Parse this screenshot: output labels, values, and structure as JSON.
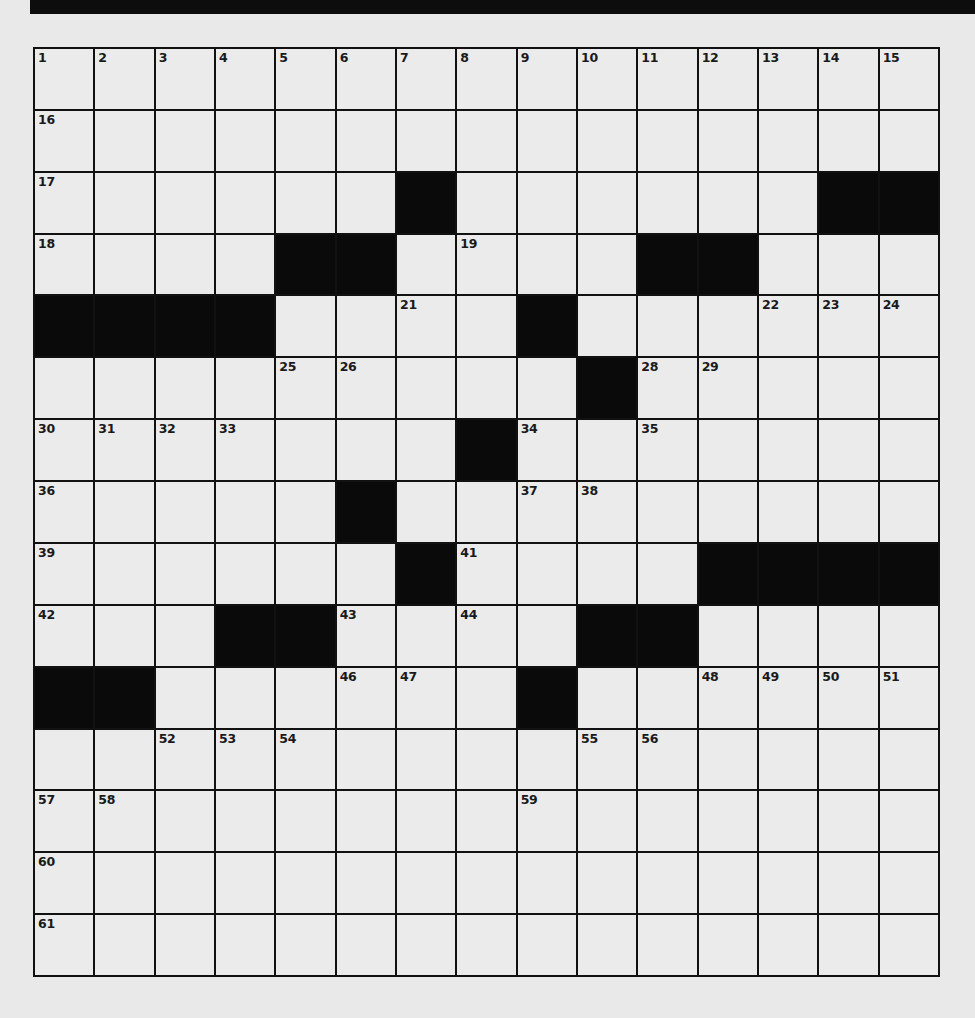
{
  "puzzle": {
    "size": {
      "rows": 15,
      "cols": 15
    },
    "colors": {
      "background": "#e9e9e9",
      "cell_white": "#ebebeb",
      "cell_black": "#0a0a0a",
      "grid_line": "#111111",
      "banner": "#0d0d0d"
    },
    "layout": [
      "...............",
      "...............",
      "......#......##",
      "....##....##...",
      "####....#......",
      ".........#.....",
      ".......#.......",
      ".....#.........",
      "......#....####",
      "...##....##....",
      "##......#......",
      "...............",
      "...............",
      "...............",
      "..............."
    ],
    "numbers": [
      {
        "row": 0,
        "col": 0,
        "n": "1"
      },
      {
        "row": 0,
        "col": 1,
        "n": "2"
      },
      {
        "row": 0,
        "col": 2,
        "n": "3"
      },
      {
        "row": 0,
        "col": 3,
        "n": "4"
      },
      {
        "row": 0,
        "col": 4,
        "n": "5"
      },
      {
        "row": 0,
        "col": 5,
        "n": "6"
      },
      {
        "row": 0,
        "col": 6,
        "n": "7"
      },
      {
        "row": 0,
        "col": 7,
        "n": "8"
      },
      {
        "row": 0,
        "col": 8,
        "n": "9"
      },
      {
        "row": 0,
        "col": 9,
        "n": "10"
      },
      {
        "row": 0,
        "col": 10,
        "n": "11"
      },
      {
        "row": 0,
        "col": 11,
        "n": "12"
      },
      {
        "row": 0,
        "col": 12,
        "n": "13"
      },
      {
        "row": 0,
        "col": 13,
        "n": "14"
      },
      {
        "row": 0,
        "col": 14,
        "n": "15"
      },
      {
        "row": 1,
        "col": 0,
        "n": "16"
      },
      {
        "row": 2,
        "col": 0,
        "n": "17"
      },
      {
        "row": 3,
        "col": 0,
        "n": "18"
      },
      {
        "row": 3,
        "col": 7,
        "n": "19"
      },
      {
        "row": 4,
        "col": 0,
        "n": "20"
      },
      {
        "row": 4,
        "col": 6,
        "n": "21"
      },
      {
        "row": 4,
        "col": 12,
        "n": "22"
      },
      {
        "row": 4,
        "col": 13,
        "n": "23"
      },
      {
        "row": 4,
        "col": 14,
        "n": "24"
      },
      {
        "row": 5,
        "col": 4,
        "n": "25"
      },
      {
        "row": 5,
        "col": 5,
        "n": "26"
      },
      {
        "row": 5,
        "col": 9,
        "n": "27"
      },
      {
        "row": 5,
        "col": 10,
        "n": "28"
      },
      {
        "row": 5,
        "col": 11,
        "n": "29"
      },
      {
        "row": 6,
        "col": 0,
        "n": "30"
      },
      {
        "row": 6,
        "col": 1,
        "n": "31"
      },
      {
        "row": 6,
        "col": 2,
        "n": "32"
      },
      {
        "row": 6,
        "col": 3,
        "n": "33"
      },
      {
        "row": 6,
        "col": 8,
        "n": "34"
      },
      {
        "row": 6,
        "col": 10,
        "n": "35"
      },
      {
        "row": 7,
        "col": 0,
        "n": "36"
      },
      {
        "row": 7,
        "col": 8,
        "n": "37"
      },
      {
        "row": 7,
        "col": 9,
        "n": "38"
      },
      {
        "row": 8,
        "col": 0,
        "n": "39"
      },
      {
        "row": 8,
        "col": 6,
        "n": "40"
      },
      {
        "row": 8,
        "col": 7,
        "n": "41"
      },
      {
        "row": 9,
        "col": 0,
        "n": "42"
      },
      {
        "row": 9,
        "col": 5,
        "n": "43"
      },
      {
        "row": 9,
        "col": 7,
        "n": "44"
      },
      {
        "row": 10,
        "col": 0,
        "n": "45"
      },
      {
        "row": 10,
        "col": 5,
        "n": "46"
      },
      {
        "row": 10,
        "col": 6,
        "n": "47"
      },
      {
        "row": 10,
        "col": 11,
        "n": "48"
      },
      {
        "row": 10,
        "col": 12,
        "n": "49"
      },
      {
        "row": 10,
        "col": 13,
        "n": "50"
      },
      {
        "row": 10,
        "col": 14,
        "n": "51"
      },
      {
        "row": 11,
        "col": 2,
        "n": "52"
      },
      {
        "row": 11,
        "col": 3,
        "n": "53"
      },
      {
        "row": 11,
        "col": 4,
        "n": "54"
      },
      {
        "row": 11,
        "col": 9,
        "n": "55"
      },
      {
        "row": 11,
        "col": 10,
        "n": "56"
      },
      {
        "row": 12,
        "col": 0,
        "n": "57"
      },
      {
        "row": 12,
        "col": 1,
        "n": "58"
      },
      {
        "row": 12,
        "col": 8,
        "n": "59"
      },
      {
        "row": 13,
        "col": 0,
        "n": "60"
      },
      {
        "row": 14,
        "col": 0,
        "n": "61"
      }
    ]
  }
}
